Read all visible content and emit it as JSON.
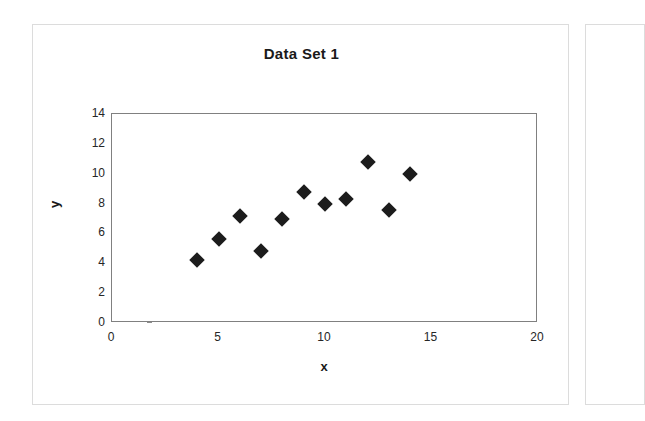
{
  "chart_data": {
    "type": "scatter",
    "title": "Data Set 1",
    "xlabel": "x",
    "ylabel": "y",
    "xlim": [
      0,
      20
    ],
    "ylim": [
      0,
      14
    ],
    "xticks": [
      0,
      5,
      10,
      15,
      20
    ],
    "yticks": [
      0,
      2,
      4,
      6,
      8,
      10,
      12,
      14
    ],
    "grid": false,
    "legend": null,
    "marker": "diamond",
    "marker_color": "#1c1c1c",
    "series": [
      {
        "name": "Data Set 1",
        "points": [
          {
            "x": 4,
            "y": 4.2
          },
          {
            "x": 5,
            "y": 5.6
          },
          {
            "x": 6,
            "y": 7.2
          },
          {
            "x": 7,
            "y": 4.8
          },
          {
            "x": 8,
            "y": 7.0
          },
          {
            "x": 9,
            "y": 8.8
          },
          {
            "x": 10,
            "y": 8.0
          },
          {
            "x": 11,
            "y": 8.3
          },
          {
            "x": 12,
            "y": 10.8
          },
          {
            "x": 13,
            "y": 7.6
          },
          {
            "x": 14,
            "y": 10.0
          }
        ]
      }
    ]
  },
  "colors": {
    "marker": "#1c1c1c",
    "axis": "#808080",
    "text": "#1a1a1a",
    "panel_border": "#dcdcdc",
    "background": "#ffffff"
  }
}
